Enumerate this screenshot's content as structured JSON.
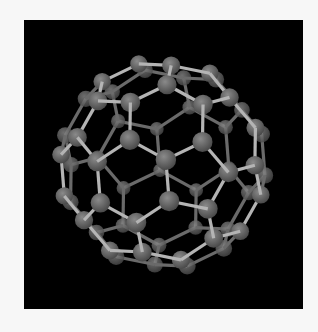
{
  "image": {
    "subject": "buckminsterfullerene-c60-molecule",
    "background_color": "#000000",
    "page_color": "#f7f7f7",
    "atom_color": "#6e6e6e",
    "bond_color": "#b4b4b4",
    "atom_count": 60
  }
}
